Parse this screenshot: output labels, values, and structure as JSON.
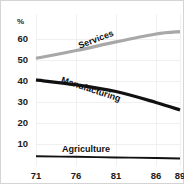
{
  "chart_data": {
    "type": "line",
    "title": "",
    "subtitle": "",
    "xlabel": "",
    "ylabel": "%",
    "ylim": [
      0,
      66
    ],
    "xlim": [
      71,
      89
    ],
    "grid": true,
    "legend_position": "inline-labels",
    "x": [
      71,
      76,
      81,
      86,
      89
    ],
    "xticklabels": [
      "71",
      "76",
      "81",
      "86",
      "89"
    ],
    "yticks": [
      10,
      20,
      30,
      40,
      50,
      60
    ],
    "yticklabels": [
      "10",
      "20",
      "30",
      "40",
      "50",
      "60"
    ],
    "series": [
      {
        "name": "Services",
        "label": "Services",
        "color": "#a8a8a8",
        "width": 3.2,
        "values": [
          50.8,
          54.5,
          58.6,
          62.4,
          63.5
        ],
        "label_x": 97,
        "label_y": 42,
        "label_rotation": -21
      },
      {
        "name": "Manufacturing",
        "label": "Manufacturing",
        "color": "#111111",
        "width": 3.2,
        "values": [
          40.5,
          38.2,
          35.0,
          29.8,
          26.2
        ],
        "label_x": 90,
        "label_y": 92,
        "label_rotation": 18
      },
      {
        "name": "Agriculture",
        "label": "Agriculture",
        "color": "#111111",
        "width": 1.9,
        "values": [
          4.2,
          3.9,
          3.6,
          3.3,
          3.1
        ],
        "label_x": 86,
        "label_y": 152,
        "label_rotation": 0
      }
    ]
  },
  "axes": {
    "y_unit_label": "%",
    "y_tick_labels": [
      "60",
      "50",
      "40",
      "30",
      "20",
      "10"
    ],
    "x_tick_labels": [
      "71",
      "76",
      "81",
      "86",
      "89"
    ]
  },
  "colors": {
    "services": "#a8a8a8",
    "manufacturing": "#111111",
    "agriculture": "#111111",
    "grid": "#e9e9e9",
    "frame": "#c9c9c9",
    "text": "#1a1a1a",
    "background": "#ffffff"
  }
}
